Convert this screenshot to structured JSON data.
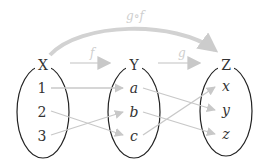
{
  "colors": {
    "ellipse_stroke": "#222222",
    "arrow": "#c8c8c8",
    "label": "#333333",
    "function_label": "#cfcfcf"
  },
  "sets": [
    {
      "name": "X",
      "elements": [
        "1",
        "2",
        "3"
      ]
    },
    {
      "name": "Y",
      "elements": [
        "a",
        "b",
        "c"
      ]
    },
    {
      "name": "Z",
      "elements": [
        "x",
        "y",
        "z"
      ]
    }
  ],
  "functions": {
    "f": {
      "label": "f",
      "from": "X",
      "to": "Y",
      "mapping": {
        "1": "a",
        "2": "c",
        "3": "b"
      }
    },
    "g": {
      "label": "g",
      "from": "Y",
      "to": "Z",
      "mapping": {
        "a": "y",
        "b": "z",
        "c": "x"
      }
    },
    "composite": {
      "label": "g∘f",
      "from": "X",
      "to": "Z"
    }
  }
}
